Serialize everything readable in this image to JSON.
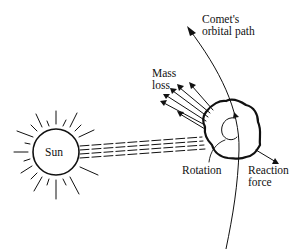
{
  "diagram": {
    "labels": {
      "sun": "Sun",
      "comet_path_line1": "Comet's",
      "comet_path_line2": "orbital path",
      "mass_loss_line1": "Mass",
      "mass_loss_line2": "loss",
      "rotation": "Rotation",
      "reaction_line1": "Reaction",
      "reaction_line2": "force"
    },
    "colors": {
      "ink": "#111111",
      "background": "#ffffff"
    }
  }
}
